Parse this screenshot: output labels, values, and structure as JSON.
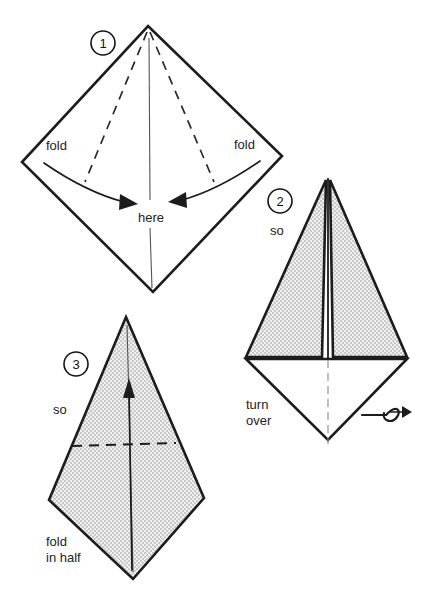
{
  "figure": {
    "type": "origami-instruction-diagram",
    "background_color": "#ffffff",
    "ink_color": "#1c1c1c",
    "paper_shade_color": "#d9d9d9",
    "steps": [
      {
        "number": "1",
        "shape": "square rotated 45 degrees (diamond)",
        "labels": [
          {
            "name": "fold-left",
            "text": "fold"
          },
          {
            "name": "fold-right",
            "text": "fold"
          },
          {
            "name": "here",
            "text": "here"
          }
        ],
        "creases": "two dashed fold lines from top vertex toward lower left and lower right; thin vertical center crease",
        "arrows": "two curved arrows pointing inward to the vertical center line"
      },
      {
        "number": "2",
        "shape": "kite with two shaded flaps folded to the center",
        "labels": [
          {
            "name": "so",
            "text": "so"
          },
          {
            "name": "turn-over-line1",
            "text": "turn"
          },
          {
            "name": "turn-over-line2",
            "text": "over"
          }
        ],
        "creases": "vertical center line; dash-dot line through lower diamond",
        "arrows": "turn-over looping arrow at lower right"
      },
      {
        "number": "3",
        "shape": "shaded kite",
        "labels": [
          {
            "name": "so",
            "text": "so"
          },
          {
            "name": "fold-in-half-line1",
            "text": "fold"
          },
          {
            "name": "fold-in-half-line2",
            "text": "in half"
          }
        ],
        "creases": "horizontal dashed fold line across the middle; vertical center crease",
        "arrows": "straight arrow pointing up along the vertical center"
      }
    ]
  },
  "step1": {
    "number": "1",
    "fold_left": "fold",
    "fold_right": "fold",
    "here": "here"
  },
  "step2": {
    "number": "2",
    "so": "so",
    "turn_line1": "turn",
    "turn_line2": "over"
  },
  "step3": {
    "number": "3",
    "so": "so",
    "fold_line1": "fold",
    "fold_line2": "in half"
  }
}
